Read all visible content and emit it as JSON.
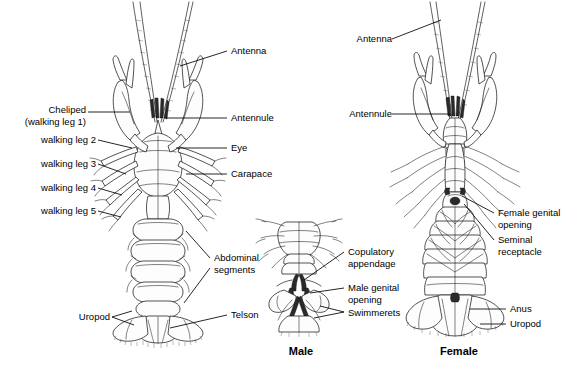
{
  "figure": {
    "background_color": "#ffffff",
    "line_color": "#1a1a1a"
  },
  "captions": [
    {
      "name": "male",
      "text": "Male",
      "x": 300,
      "y": 345
    },
    {
      "name": "female",
      "text": "Female",
      "x": 459,
      "y": 345
    }
  ],
  "labels": {
    "dorsal_left": [
      {
        "name": "cheliped",
        "line1": "Cheliped",
        "line2": "(walking leg 1)",
        "x": 16,
        "y": 104
      },
      {
        "name": "walking-leg-2",
        "line1": "walking leg 2",
        "line2": "",
        "x": 16,
        "y": 140
      },
      {
        "name": "walking-leg-3",
        "line1": "walking leg 3",
        "line2": "",
        "x": 16,
        "y": 164
      },
      {
        "name": "walking-leg-4",
        "line1": "walking leg 4",
        "line2": "",
        "x": 16,
        "y": 188
      },
      {
        "name": "walking-leg-5",
        "line1": "walking leg 5",
        "line2": "",
        "x": 16,
        "y": 211
      },
      {
        "name": "uropod-left",
        "line1": "Uropod",
        "line2": "",
        "x": 74,
        "y": 313
      }
    ],
    "dorsal_right": [
      {
        "name": "antenna",
        "line1": "Antenna",
        "line2": "",
        "x": 231,
        "y": 47
      },
      {
        "name": "antennule",
        "line1": "Antennule",
        "line2": "",
        "x": 231,
        "y": 114
      },
      {
        "name": "eye",
        "line1": "Eye",
        "line2": "",
        "x": 231,
        "y": 144
      },
      {
        "name": "carapace",
        "line1": "Carapace",
        "line2": "",
        "x": 231,
        "y": 170
      },
      {
        "name": "abdominal-segments",
        "line1": "Abdominal",
        "line2": "segments",
        "x": 214,
        "y": 251
      },
      {
        "name": "telson",
        "line1": "Telson",
        "line2": "",
        "x": 231,
        "y": 311
      }
    ],
    "male": [
      {
        "name": "copulatory-appendage",
        "line1": "Copulatory",
        "line2": "appendage",
        "x": 348,
        "y": 246
      },
      {
        "name": "male-genital-opening",
        "line1": "Male genital",
        "line2": "opening",
        "x": 348,
        "y": 282
      },
      {
        "name": "swimmerets",
        "line1": "Swimmerets",
        "line2": "",
        "x": 348,
        "y": 308
      }
    ],
    "female": [
      {
        "name": "antenna",
        "line1": "Antenna",
        "line2": "",
        "x": 343,
        "y": 35
      },
      {
        "name": "antennule",
        "line1": "Antennule",
        "line2": "",
        "x": 343,
        "y": 110
      },
      {
        "name": "female-genital-opening",
        "line1": "Female genital",
        "line2": "opening",
        "x": 498,
        "y": 208
      },
      {
        "name": "seminal-receptacle",
        "line1": "Seminal",
        "line2": "receptacle",
        "x": 498,
        "y": 235
      },
      {
        "name": "anus",
        "line1": "Anus",
        "line2": "",
        "x": 510,
        "y": 305
      },
      {
        "name": "uropod",
        "line1": "Uropod",
        "line2": "",
        "x": 510,
        "y": 320
      }
    ]
  }
}
